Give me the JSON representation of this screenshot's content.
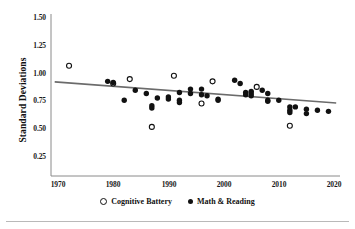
{
  "chart_data": {
    "type": "scatter",
    "title": "",
    "xlabel": "",
    "ylabel": "Standard Deviations",
    "xlim": [
      1968,
      2021
    ],
    "ylim": [
      0.12,
      1.58
    ],
    "xticks": [
      1970,
      1980,
      1990,
      2000,
      2010,
      2020
    ],
    "xtick_labels": [
      "1970",
      "1980",
      "1990",
      "2000",
      "2010",
      "2020"
    ],
    "yticks": [
      0.25,
      0.5,
      0.75,
      1.0,
      1.25,
      1.5
    ],
    "ytick_labels": [
      "0.25",
      "0.50",
      "0.75",
      "1.00",
      "1.25",
      "1.50"
    ],
    "grid": false,
    "legend_position": "below-axes",
    "series": [
      {
        "name": "Cognitive Battery",
        "marker": "open-circle",
        "color": "#111111",
        "points": [
          {
            "x": 1972,
            "y": 1.03
          },
          {
            "x": 1980,
            "y": 0.87
          },
          {
            "x": 1983,
            "y": 0.91
          },
          {
            "x": 1987,
            "y": 0.48
          },
          {
            "x": 1991,
            "y": 0.94
          },
          {
            "x": 1996,
            "y": 0.69
          },
          {
            "x": 1998,
            "y": 0.89
          },
          {
            "x": 2006,
            "y": 0.84
          },
          {
            "x": 2012,
            "y": 0.49
          }
        ]
      },
      {
        "name": "Math & Reading",
        "marker": "filled-circle",
        "color": "#111111",
        "points": [
          {
            "x": 1979,
            "y": 0.89
          },
          {
            "x": 1980,
            "y": 0.88
          },
          {
            "x": 1982,
            "y": 0.72
          },
          {
            "x": 1984,
            "y": 0.81
          },
          {
            "x": 1986,
            "y": 0.78
          },
          {
            "x": 1987,
            "y": 0.67
          },
          {
            "x": 1987,
            "y": 0.65
          },
          {
            "x": 1988,
            "y": 0.74
          },
          {
            "x": 1990,
            "y": 0.75
          },
          {
            "x": 1990,
            "y": 0.73
          },
          {
            "x": 1992,
            "y": 0.79
          },
          {
            "x": 1992,
            "y": 0.72
          },
          {
            "x": 1992,
            "y": 0.7
          },
          {
            "x": 1994,
            "y": 0.82
          },
          {
            "x": 1994,
            "y": 0.78
          },
          {
            "x": 1996,
            "y": 0.82
          },
          {
            "x": 1996,
            "y": 0.77
          },
          {
            "x": 1997,
            "y": 0.76
          },
          {
            "x": 1999,
            "y": 0.73
          },
          {
            "x": 1999,
            "y": 0.72
          },
          {
            "x": 2002,
            "y": 0.9
          },
          {
            "x": 2003,
            "y": 0.87
          },
          {
            "x": 2004,
            "y": 0.79
          },
          {
            "x": 2004,
            "y": 0.77
          },
          {
            "x": 2005,
            "y": 0.8
          },
          {
            "x": 2005,
            "y": 0.78
          },
          {
            "x": 2005,
            "y": 0.76
          },
          {
            "x": 2007,
            "y": 0.81
          },
          {
            "x": 2008,
            "y": 0.78
          },
          {
            "x": 2008,
            "y": 0.72
          },
          {
            "x": 2008,
            "y": 0.71
          },
          {
            "x": 2010,
            "y": 0.72
          },
          {
            "x": 2012,
            "y": 0.66
          },
          {
            "x": 2012,
            "y": 0.63
          },
          {
            "x": 2012,
            "y": 0.61
          },
          {
            "x": 2013,
            "y": 0.66
          },
          {
            "x": 2015,
            "y": 0.64
          },
          {
            "x": 2015,
            "y": 0.6
          },
          {
            "x": 2017,
            "y": 0.63
          },
          {
            "x": 2019,
            "y": 0.62
          }
        ]
      }
    ],
    "trendline": {
      "name": "fitted-trend",
      "color": "#6b6b6b",
      "x_start": 1969.4,
      "y_start": 0.885,
      "x_end": 2020.4,
      "y_end": 0.695
    },
    "legend": [
      {
        "label": "Cognitive Battery",
        "marker": "open-circle"
      },
      {
        "label": "Math & Reading",
        "marker": "filled-circle"
      }
    ]
  }
}
